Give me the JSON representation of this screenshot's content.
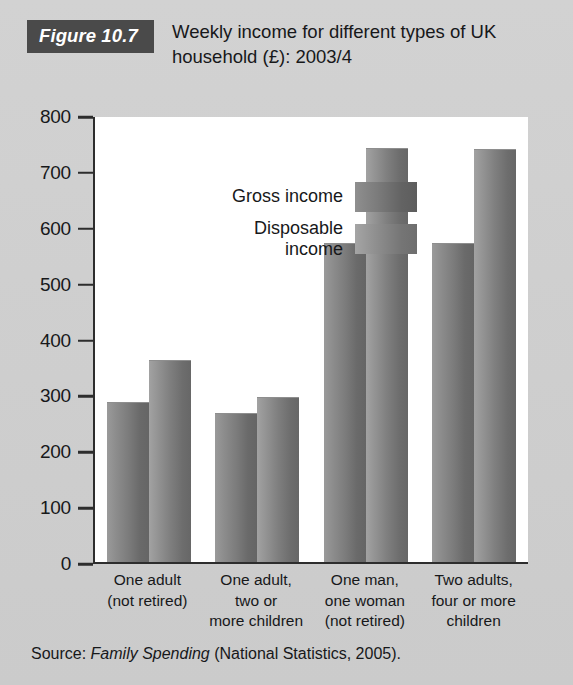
{
  "figure": {
    "tag": "Figure 10.7",
    "title": "Weekly income for different types of UK household (£): 2003/4",
    "source_prefix": "Source:",
    "source_italic": "Family Spending",
    "source_suffix": "(National Statistics, 2005)."
  },
  "legend": {
    "items": [
      {
        "label": "Gross income",
        "color": "#6f6f6f"
      },
      {
        "label": "Disposable\nincome",
        "color": "#7f7f7f"
      }
    ]
  },
  "axis": {
    "y_ticks": [
      "800",
      "700",
      "600",
      "500",
      "400",
      "300",
      "200",
      "100",
      "0"
    ]
  },
  "chart_data": {
    "type": "bar",
    "title": "Weekly income for different types of UK household (£): 2003/4",
    "xlabel": "",
    "ylabel": "",
    "ylim": [
      0,
      800
    ],
    "ytick_step": 100,
    "grid": false,
    "legend_position": "inside-top-left",
    "categories": [
      "One adult\n(not retired)",
      "One adult,\ntwo or\nmore children",
      "One man,\none woman\n(not retired)",
      "Two adults,\nfour or more\nchildren"
    ],
    "series": [
      {
        "name": "Gross income",
        "values": [
          285,
          265,
          570,
          570
        ],
        "color": "#6f6f6f"
      },
      {
        "name": "Disposable income",
        "values": [
          360,
          293,
          740,
          738
        ],
        "color": "#7f7f7f"
      }
    ]
  }
}
